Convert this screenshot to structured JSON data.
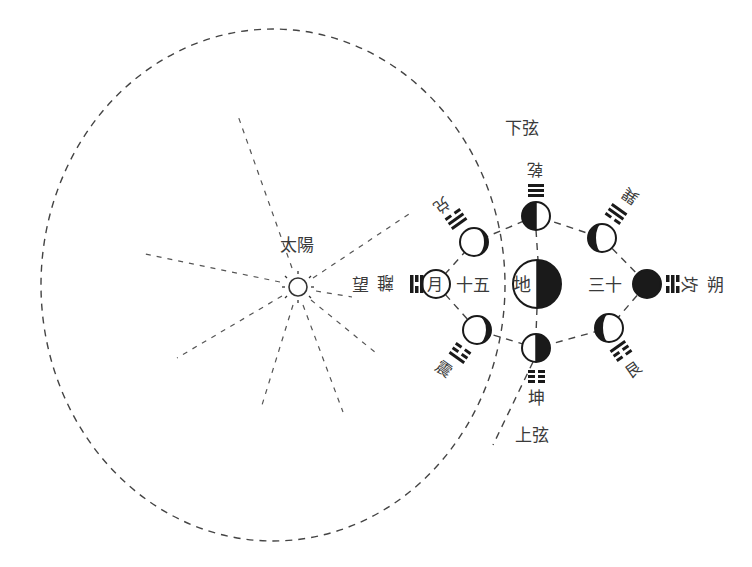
{
  "diagram": {
    "colors": {
      "ink": "#1a1a1a",
      "line": "#444444",
      "text": "#3a3a3a",
      "background": "#ffffff"
    },
    "sun": {
      "label": "太陽",
      "icon": "sun-icon"
    },
    "earth": {
      "label": "地",
      "phase": "right-half-dark"
    },
    "labels": {
      "last_quarter": "下弦",
      "first_quarter": "上弦",
      "full_moon": "望",
      "new_moon": "朔",
      "day_15": "十五",
      "day_30": "三十"
    },
    "moons": [
      {
        "id": "li",
        "name": "離",
        "trigram": "☲",
        "phase": "full",
        "glyph": "月"
      },
      {
        "id": "dui",
        "name": "兑",
        "trigram": "☱",
        "phase": "waxing-gibbous-right-dark"
      },
      {
        "id": "qian",
        "name": "乾",
        "trigram": "☰",
        "phase": "left-half-dark"
      },
      {
        "id": "xun",
        "name": "巽",
        "trigram": "☴",
        "phase": "crescent-right-light"
      },
      {
        "id": "kan",
        "name": "坎",
        "trigram": "☵",
        "phase": "new"
      },
      {
        "id": "gen",
        "name": "艮",
        "trigram": "☶",
        "phase": "crescent-right-light"
      },
      {
        "id": "kun",
        "name": "坤",
        "trigram": "☷",
        "phase": "right-half-dark"
      },
      {
        "id": "zhen",
        "name": "震",
        "trigram": "☳",
        "phase": "gibbous-right-dark"
      }
    ]
  }
}
